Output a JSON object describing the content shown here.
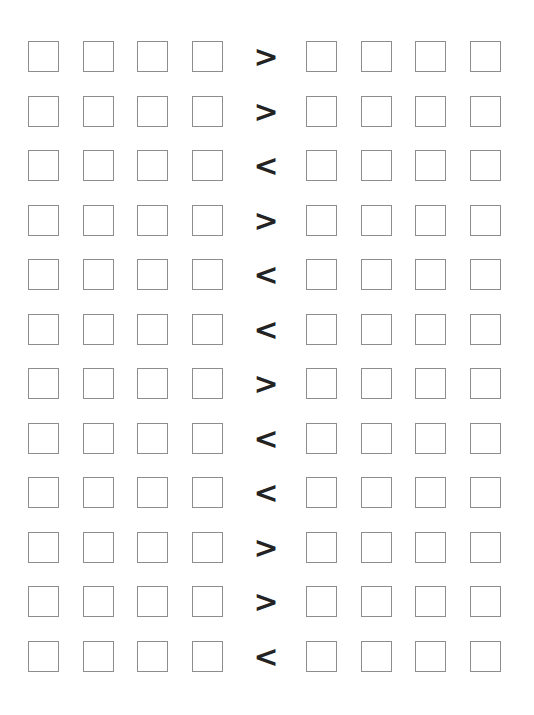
{
  "worksheet": {
    "title": "Comparison worksheet",
    "background_color": "#ffffff",
    "box_border_color": "#8d8d8d",
    "box_fill_color": "#ffffff",
    "operator_color": "#232323",
    "columns_per_group": 4,
    "groups_per_row": 2,
    "row_count": 12,
    "box_label": "",
    "box_placeholder": "",
    "rows": [
      {
        "index": 1,
        "operator": ">",
        "operator_name": "greater-than",
        "left": [
          "",
          "",
          "",
          ""
        ],
        "right": [
          "",
          "",
          "",
          ""
        ]
      },
      {
        "index": 2,
        "operator": ">",
        "operator_name": "greater-than",
        "left": [
          "",
          "",
          "",
          ""
        ],
        "right": [
          "",
          "",
          "",
          ""
        ]
      },
      {
        "index": 3,
        "operator": "<",
        "operator_name": "less-than",
        "left": [
          "",
          "",
          "",
          ""
        ],
        "right": [
          "",
          "",
          "",
          ""
        ]
      },
      {
        "index": 4,
        "operator": ">",
        "operator_name": "greater-than",
        "left": [
          "",
          "",
          "",
          ""
        ],
        "right": [
          "",
          "",
          "",
          ""
        ]
      },
      {
        "index": 5,
        "operator": "<",
        "operator_name": "less-than",
        "left": [
          "",
          "",
          "",
          ""
        ],
        "right": [
          "",
          "",
          "",
          ""
        ]
      },
      {
        "index": 6,
        "operator": "<",
        "operator_name": "less-than",
        "left": [
          "",
          "",
          "",
          ""
        ],
        "right": [
          "",
          "",
          "",
          ""
        ]
      },
      {
        "index": 7,
        "operator": ">",
        "operator_name": "greater-than",
        "left": [
          "",
          "",
          "",
          ""
        ],
        "right": [
          "",
          "",
          "",
          ""
        ]
      },
      {
        "index": 8,
        "operator": "<",
        "operator_name": "less-than",
        "left": [
          "",
          "",
          "",
          ""
        ],
        "right": [
          "",
          "",
          "",
          ""
        ]
      },
      {
        "index": 9,
        "operator": "<",
        "operator_name": "less-than",
        "left": [
          "",
          "",
          "",
          ""
        ],
        "right": [
          "",
          "",
          "",
          ""
        ]
      },
      {
        "index": 10,
        "operator": ">",
        "operator_name": "greater-than",
        "left": [
          "",
          "",
          "",
          ""
        ],
        "right": [
          "",
          "",
          "",
          ""
        ]
      },
      {
        "index": 11,
        "operator": ">",
        "operator_name": "greater-than",
        "left": [
          "",
          "",
          "",
          ""
        ],
        "right": [
          "",
          "",
          "",
          ""
        ]
      },
      {
        "index": 12,
        "operator": "<",
        "operator_name": "less-than",
        "left": [
          "",
          "",
          "",
          ""
        ],
        "right": [
          "",
          "",
          "",
          ""
        ]
      }
    ]
  }
}
